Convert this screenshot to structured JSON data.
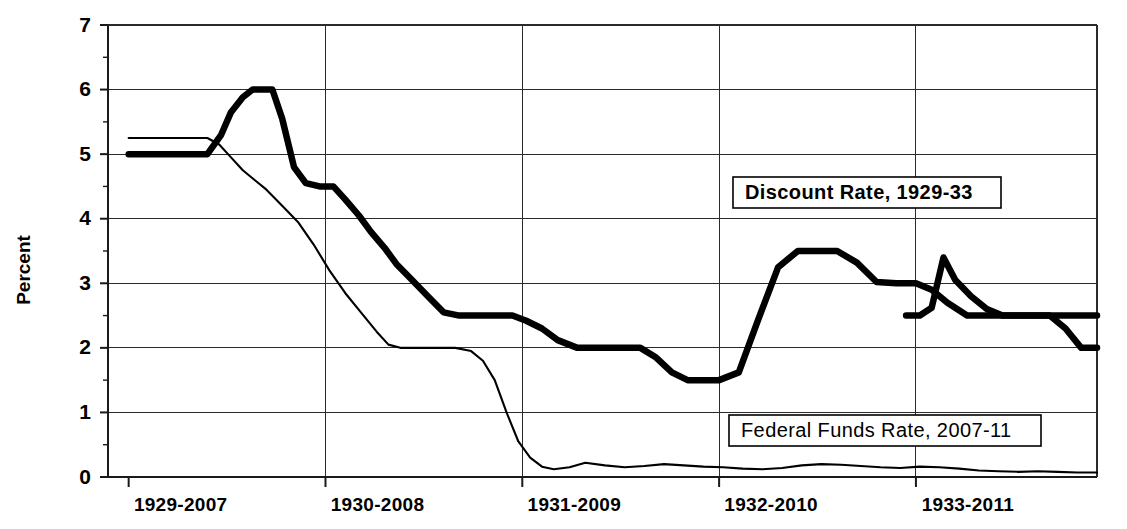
{
  "chart_data": {
    "type": "line",
    "title": "",
    "xlabel": "",
    "ylabel": "Percent",
    "ylim": [
      0,
      7
    ],
    "yticks": [
      0,
      1,
      2,
      3,
      4,
      5,
      6,
      7
    ],
    "ytick_labels": [
      "0",
      "1",
      "2",
      "3",
      "4",
      "5",
      "6",
      "7"
    ],
    "xtick_labels": [
      "1929-2007",
      "1930-2008",
      "1931-2009",
      "1932-2010",
      "1933-2011"
    ],
    "xtick_positions": [
      0,
      1,
      2,
      3,
      4
    ],
    "xlim": [
      -0.105,
      4.92
    ],
    "grid": true,
    "legend_position": "inside-right",
    "legend": [
      {
        "name": "Discount Rate, 1929-33",
        "style": "thick",
        "bold": true,
        "box_x": 733,
        "box_y": 177,
        "box_w": 268,
        "box_h": 31
      },
      {
        "name": "Federal Funds Rate, 2007-11",
        "style": "thin",
        "bold": false,
        "box_x": 729,
        "box_y": 415,
        "box_w": 312,
        "box_h": 31
      }
    ],
    "series": [
      {
        "name": "Discount Rate, 1929-33",
        "style": "thick",
        "x": [
          0.0,
          0.1,
          0.22,
          0.32,
          0.4,
          0.47,
          0.52,
          0.58,
          0.63,
          0.68,
          0.73,
          0.78,
          0.84,
          0.9,
          0.97,
          1.04,
          1.1,
          1.17,
          1.23,
          1.3,
          1.36,
          1.44,
          1.52,
          1.6,
          1.68,
          1.76,
          1.85,
          1.95,
          2.02,
          2.1,
          2.18,
          2.28,
          2.36,
          2.44,
          2.52,
          2.6,
          2.68,
          2.76,
          2.84,
          2.93,
          3.0,
          3.1,
          3.2,
          3.3,
          3.4,
          3.5,
          3.6,
          3.7,
          3.8,
          3.9,
          4.0,
          4.08,
          4.16,
          4.26,
          4.36,
          4.46,
          4.56,
          4.66,
          4.76,
          4.86,
          4.92
        ],
        "y": [
          5.0,
          5.0,
          5.0,
          5.0,
          5.0,
          5.3,
          5.65,
          5.88,
          6.0,
          6.0,
          6.0,
          5.55,
          4.8,
          4.55,
          4.5,
          4.5,
          4.3,
          4.05,
          3.8,
          3.55,
          3.3,
          3.05,
          2.8,
          2.55,
          2.5,
          2.5,
          2.5,
          2.5,
          2.42,
          2.3,
          2.12,
          2.0,
          2.0,
          2.0,
          2.0,
          2.0,
          1.85,
          1.62,
          1.5,
          1.5,
          1.5,
          1.62,
          2.45,
          3.25,
          3.5,
          3.5,
          3.5,
          3.32,
          3.02,
          3.0,
          3.0,
          2.9,
          2.7,
          2.5,
          2.5,
          2.5,
          2.5,
          2.5,
          2.5,
          2.5,
          2.5
        ],
        "note": "stepwise discount rate series, 1929-33"
      },
      {
        "name": "Discount Rate, 1929-33 (continued right segment)",
        "style": "thick",
        "x": [
          3.95,
          4.02,
          4.08,
          4.14,
          4.2,
          4.28,
          4.36,
          4.44,
          4.52,
          4.6,
          4.68,
          4.76,
          4.84,
          4.92
        ],
        "y": [
          2.5,
          2.5,
          2.62,
          3.4,
          3.05,
          2.8,
          2.6,
          2.5,
          2.5,
          2.5,
          2.5,
          2.3,
          2.0,
          2.0
        ],
        "note": "late spike to 3.4 then decline to 2.0"
      },
      {
        "name": "Federal Funds Rate, 2007-11",
        "style": "thin",
        "x": [
          0.0,
          0.1,
          0.2,
          0.3,
          0.4,
          0.46,
          0.52,
          0.58,
          0.64,
          0.7,
          0.78,
          0.86,
          0.94,
          1.02,
          1.1,
          1.18,
          1.26,
          1.32,
          1.38,
          1.44,
          1.5,
          1.58,
          1.66,
          1.74,
          1.8,
          1.86,
          1.92,
          1.98,
          2.04,
          2.1,
          2.16,
          2.24,
          2.32,
          2.42,
          2.52,
          2.62,
          2.72,
          2.82,
          2.92,
          3.02,
          3.12,
          3.22,
          3.32,
          3.42,
          3.52,
          3.62,
          3.72,
          3.82,
          3.92,
          4.02,
          4.12,
          4.22,
          4.32,
          4.42,
          4.52,
          4.62,
          4.72,
          4.82,
          4.92
        ],
        "y": [
          5.25,
          5.25,
          5.25,
          5.25,
          5.25,
          5.15,
          4.95,
          4.75,
          4.6,
          4.45,
          4.2,
          3.95,
          3.6,
          3.2,
          2.85,
          2.55,
          2.25,
          2.05,
          2.0,
          2.0,
          2.0,
          2.0,
          2.0,
          1.95,
          1.8,
          1.5,
          1.0,
          0.55,
          0.3,
          0.16,
          0.12,
          0.15,
          0.22,
          0.18,
          0.15,
          0.17,
          0.2,
          0.18,
          0.16,
          0.15,
          0.13,
          0.12,
          0.14,
          0.18,
          0.2,
          0.19,
          0.17,
          0.15,
          0.14,
          0.16,
          0.15,
          0.13,
          0.1,
          0.09,
          0.08,
          0.09,
          0.08,
          0.07,
          0.07
        ],
        "note": "federal funds rate 2007-2011, falls to near zero lower bound"
      }
    ]
  },
  "layout": {
    "plot_left": 108,
    "plot_right": 1097,
    "plot_top": 25,
    "plot_bottom": 477,
    "x_unit_px": 201,
    "y_unit_px": 64.57
  }
}
